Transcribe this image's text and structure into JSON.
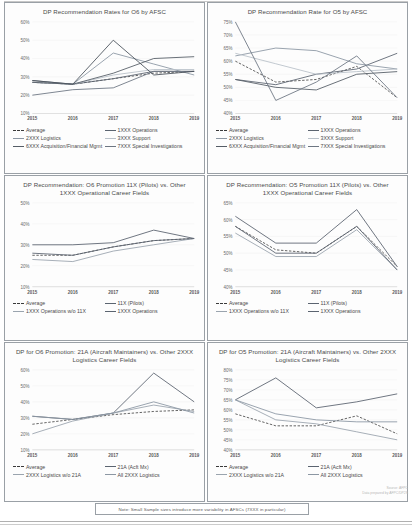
{
  "document": {
    "note": "Note:  Small Sample sizes introduce more variability in AFSCs (7XXX in particular)",
    "source_line1": "Source: AFPC",
    "source_line2": "Data prepared by AFPC/DP2S"
  },
  "colors": {
    "average": "#3a3a3a",
    "ops": "#5b6470",
    "logistics": "#8c97a3",
    "support": "#b9c1c9",
    "acq": "#555d66",
    "spec_inv": "#6d7682",
    "pilots": "#5b6470",
    "ops_wo_11x": "#9aa4ae",
    "acft_mx": "#5b6470",
    "log_wo_21a": "#9aa4ae",
    "all_log": "#8c97a3"
  },
  "chart_data": [
    {
      "id": "chart-o6-by-afsc",
      "type": "line",
      "title": "DP Recommendation Rates for O6 by AFSC",
      "xlabel": "",
      "ylabel": "",
      "categories": [
        "2015",
        "2016",
        "2017",
        "2018",
        "2019"
      ],
      "yticks": [
        "60%",
        "50%",
        "40%",
        "30%",
        "20%",
        "10%"
      ],
      "ylim": [
        10,
        60
      ],
      "grid": false,
      "legend_position": "bottom",
      "series": [
        {
          "name": "Average",
          "style": "dashed",
          "color": "#3a3a3a",
          "values": [
            27,
            26,
            29,
            32,
            33
          ]
        },
        {
          "name": "1XXX Operations",
          "style": "solid",
          "color": "#5b6470",
          "values": [
            28,
            26,
            29,
            33,
            33
          ]
        },
        {
          "name": "2XXX Logistics",
          "style": "solid",
          "color": "#8c97a3",
          "values": [
            27,
            26,
            43,
            37,
            31
          ]
        },
        {
          "name": "3XXX Support",
          "style": "solid",
          "color": "#b9c1c9",
          "values": [
            27,
            26,
            31,
            34,
            34
          ]
        },
        {
          "name": "6XXX Acquisition/Financial Mgmt",
          "style": "solid",
          "color": "#555d66",
          "values": [
            27,
            26,
            32,
            40,
            41
          ]
        },
        {
          "name": "7XXX Special Investigations",
          "style": "solid",
          "color": "#6d7682",
          "values": [
            20,
            23,
            24,
            33,
            33
          ]
        }
      ],
      "peak_series": {
        "name": "1XXX Operations",
        "values": [
          28,
          26,
          50,
          31,
          33
        ]
      }
    },
    {
      "id": "chart-o5-by-afsc",
      "type": "line",
      "title": "DP Recommendation Rate for O5 by AFSC",
      "xlabel": "",
      "ylabel": "",
      "categories": [
        "2015",
        "2016",
        "2017",
        "2018",
        "2019"
      ],
      "yticks": [
        "75%",
        "70%",
        "65%",
        "60%",
        "55%",
        "50%",
        "45%",
        "40%"
      ],
      "ylim": [
        40,
        75
      ],
      "grid": false,
      "legend_position": "bottom",
      "series": [
        {
          "name": "Average",
          "style": "dashed",
          "color": "#3a3a3a",
          "values": [
            60,
            52,
            53,
            58,
            46
          ]
        },
        {
          "name": "1XXX Operations",
          "style": "solid",
          "color": "#5b6470",
          "values": [
            53,
            51,
            55,
            57,
            63
          ]
        },
        {
          "name": "2XXX Logistics",
          "style": "solid",
          "color": "#8c97a3",
          "values": [
            62,
            65,
            64,
            59,
            57
          ]
        },
        {
          "name": "3XXX Support",
          "style": "solid",
          "color": "#b9c1c9",
          "values": [
            63,
            59,
            55,
            56,
            57
          ]
        },
        {
          "name": "6XXX Acquisition/Financial Mgmt",
          "style": "solid",
          "color": "#555d66",
          "values": [
            53,
            50,
            49,
            55,
            56
          ]
        },
        {
          "name": "7XXX Special Investigations",
          "style": "solid",
          "color": "#6d7682",
          "values": [
            75,
            45,
            52,
            62,
            46
          ]
        }
      ]
    },
    {
      "id": "chart-o6-11x",
      "type": "line",
      "title": "DP Recommendation: O6 Promotion 11X (Pilots) vs. Other 1XXX Operational Career Fields",
      "xlabel": "",
      "ylabel": "",
      "categories": [
        "2015",
        "2016",
        "2017",
        "2018",
        "2019"
      ],
      "yticks": [
        "50%",
        "40%",
        "30%",
        "20%",
        "10%"
      ],
      "ylim": [
        10,
        50
      ],
      "grid": false,
      "legend_position": "bottom",
      "series": [
        {
          "name": "Average",
          "style": "dashed",
          "color": "#3a3a3a",
          "values": [
            25,
            25,
            29,
            32,
            33
          ]
        },
        {
          "name": "11X (Pilots)",
          "style": "solid",
          "color": "#5b6470",
          "values": [
            30,
            30,
            31,
            37,
            33
          ]
        },
        {
          "name": "1XXX Operations w/o 11X",
          "style": "solid",
          "color": "#9aa4ae",
          "values": [
            23,
            22,
            27,
            30,
            33
          ]
        },
        {
          "name": "1XXX Operations",
          "style": "solid",
          "color": "#5b6470",
          "values": [
            26,
            25,
            29,
            32,
            33
          ]
        }
      ]
    },
    {
      "id": "chart-o5-11x",
      "type": "line",
      "title": "DP Recommendation: O5 Promotion 11X (Pilots) vs. Other 1XXX Operational Career Fields",
      "xlabel": "",
      "ylabel": "",
      "categories": [
        "2015",
        "2016",
        "2017",
        "2018",
        "2019"
      ],
      "yticks": [
        "65%",
        "60%",
        "55%",
        "50%",
        "45%",
        "40%"
      ],
      "ylim": [
        40,
        65
      ],
      "grid": false,
      "legend_position": "bottom",
      "series": [
        {
          "name": "Average",
          "style": "dashed",
          "color": "#3a3a3a",
          "values": [
            58,
            51,
            50,
            58,
            46
          ]
        },
        {
          "name": "11X (Pilots)",
          "style": "solid",
          "color": "#5b6470",
          "values": [
            61,
            53,
            53,
            63,
            46
          ]
        },
        {
          "name": "1XXX Operations w/o 11X",
          "style": "solid",
          "color": "#9aa4ae",
          "values": [
            56,
            49,
            49,
            57,
            45
          ]
        },
        {
          "name": "1XXX Operations",
          "style": "solid",
          "color": "#5b6470",
          "values": [
            58,
            50,
            50,
            58,
            45
          ]
        }
      ]
    },
    {
      "id": "chart-o6-21a",
      "type": "line",
      "title": "DP for O6 Promotion: 21A (Aircraft Maintainers) vs. Other 2XXX Logistics Career Fields",
      "xlabel": "",
      "ylabel": "",
      "categories": [
        "2015",
        "2016",
        "2017",
        "2018",
        "2019"
      ],
      "yticks": [
        "60%",
        "50%",
        "40%",
        "30%",
        "20%",
        "10%"
      ],
      "ylim": [
        10,
        60
      ],
      "grid": false,
      "legend_position": "bottom",
      "series": [
        {
          "name": "Average",
          "style": "dashed",
          "color": "#3a3a3a",
          "values": [
            26,
            29,
            32,
            34,
            35
          ]
        },
        {
          "name": "21A (Acft Mx)",
          "style": "solid",
          "color": "#5b6470",
          "values": [
            31,
            29,
            33,
            58,
            40
          ]
        },
        {
          "name": "2XXX Logistics w/o 21A",
          "style": "solid",
          "color": "#9aa4ae",
          "values": [
            20,
            28,
            33,
            38,
            34
          ]
        },
        {
          "name": "All 2XXX Logistics",
          "style": "solid",
          "color": "#8c97a3",
          "values": [
            31,
            29,
            33,
            40,
            33
          ]
        }
      ]
    },
    {
      "id": "chart-o5-21a",
      "type": "line",
      "title": "DP for O5 Promotion: 21A (Aircraft Maintainers) vs. Other 2XXX Logistics Career Fields",
      "xlabel": "",
      "ylabel": "",
      "categories": [
        "2015",
        "2016",
        "2017",
        "2018",
        "2019"
      ],
      "yticks": [
        "80%",
        "75%",
        "70%",
        "65%",
        "60%",
        "55%",
        "50%",
        "45%",
        "40%"
      ],
      "ylim": [
        40,
        80
      ],
      "grid": false,
      "legend_position": "bottom",
      "series": [
        {
          "name": "Average",
          "style": "dashed",
          "color": "#3a3a3a",
          "values": [
            58,
            52,
            52,
            57,
            48
          ]
        },
        {
          "name": "21A (Acft Mx)",
          "style": "solid",
          "color": "#5b6470",
          "values": [
            65,
            76,
            61,
            64,
            68
          ]
        },
        {
          "name": "2XXX Logistics w/o 21A",
          "style": "solid",
          "color": "#9aa4ae",
          "values": [
            65,
            55,
            53,
            49,
            45
          ]
        },
        {
          "name": "All 2XXX Logistics",
          "style": "solid",
          "color": "#8c97a3",
          "values": [
            65,
            58,
            55,
            54,
            54
          ]
        }
      ]
    }
  ]
}
